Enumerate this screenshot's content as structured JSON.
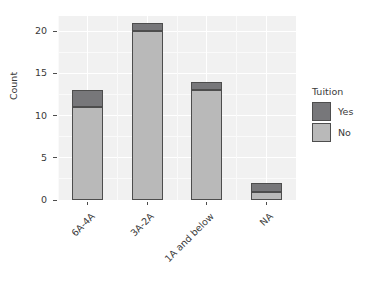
{
  "chart_data": {
    "type": "bar",
    "title": "",
    "subtitle": "",
    "xlabel": "",
    "ylabel": "Count",
    "stacked": true,
    "categories": [
      "6A-4A",
      "3A-2A",
      "1A and below",
      "NA"
    ],
    "series": [
      {
        "name": "Yes",
        "values": [
          2,
          1,
          1,
          1
        ],
        "color": "#77777A"
      },
      {
        "name": "No",
        "values": [
          11,
          20,
          13,
          1
        ],
        "color": "#B9B9B9"
      }
    ],
    "totals": [
      13,
      21,
      14,
      2
    ],
    "ylim": [
      0,
      21.8
    ],
    "yticks": [
      0,
      5,
      10,
      15,
      20
    ],
    "ytick_labels": [
      "0",
      "5",
      "10",
      "15",
      "20"
    ],
    "grid": true,
    "legend": {
      "title": "Tuition",
      "position": "right",
      "entries": [
        {
          "label": "Yes",
          "color": "#77777A"
        },
        {
          "label": "No",
          "color": "#B9B9B9"
        }
      ]
    },
    "panel_background": "#F1F1F1",
    "gridline_color": "#FFFFFF",
    "axis_text_color": "#3A3A3A",
    "xlabel_rotation_deg": -45
  }
}
